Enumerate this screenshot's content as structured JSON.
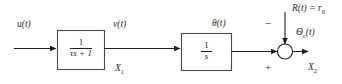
{
  "diagram": {
    "type": "control-block-diagram",
    "background_color": "#ffffff",
    "line_color": "#1f1f1f",
    "text_color": "#2b2b2b"
  },
  "labels": {
    "input_signal": "u(t)",
    "intermediate_signal": "v(t)",
    "state_one": "X",
    "state_one_sub": "1",
    "theta_signal": "θ(t)",
    "reference_input": "R(t) = r",
    "reference_input_sub": "0",
    "error_output": "Θ",
    "error_output_sub": "c",
    "error_output_tail": "(t)",
    "state_two": "X",
    "state_two_sub": "2",
    "minus_sign": "−",
    "plus_sign": "+"
  },
  "blocks": [
    {
      "name": "first-order-lag",
      "numerator": "1",
      "denominator": "τs + 1",
      "transfer_function": "1/(τs + 1)"
    },
    {
      "name": "integrator",
      "numerator": "1",
      "denominator": "s",
      "transfer_function": "1/s"
    }
  ],
  "summing_junction": {
    "name": "summing-junction",
    "shape": "circle",
    "inputs": [
      "theta-path",
      "reference-input"
    ],
    "signs": [
      "−",
      "+"
    ]
  }
}
